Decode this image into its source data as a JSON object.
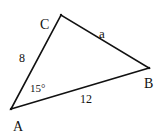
{
  "diagram": {
    "type": "triangle",
    "vertices": {
      "A": {
        "label": "A",
        "x": 11,
        "y": 109
      },
      "B": {
        "label": "B",
        "x": 149,
        "y": 68
      },
      "C": {
        "label": "C",
        "x": 61,
        "y": 15
      }
    },
    "sides": {
      "AC": {
        "label": "8"
      },
      "AB": {
        "label": "12"
      },
      "BC": {
        "label": "a"
      }
    },
    "angles": {
      "A": {
        "label": "15°"
      }
    },
    "colors": {
      "stroke": "#111111",
      "background": "#ffffff"
    }
  }
}
